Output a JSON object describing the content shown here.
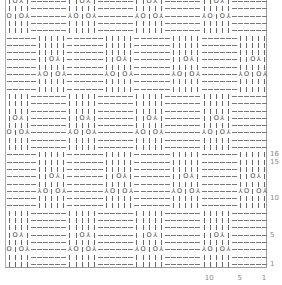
{
  "chart": {
    "title": "",
    "columns": 43,
    "rows": 37,
    "stitch_repeat": 11,
    "row_repeat": 16,
    "symbols": {
      "knit": "|",
      "purl": "-",
      "yarn_over": "O",
      "decrease": "⅄"
    },
    "lower_half": {
      "row_range": [
        1,
        8
      ],
      "purl_cols": [
        1,
        6
      ],
      "knit_cols": [
        7,
        11
      ],
      "motifs": {
        "3": {
          "11": "dec",
          "10": "yo",
          "9": "knit",
          "8": "yo",
          "7": "dec"
        },
        "5": {
          "11": "knit",
          "10": "knit",
          "9": "yo",
          "8": "dec",
          "7": "knit"
        }
      }
    },
    "upper_half": {
      "row_range": [
        9,
        16
      ],
      "knit_cols": [
        1,
        5
      ],
      "purl_cols": [
        6,
        11
      ],
      "motifs": {
        "11": {
          "5": "dec",
          "4": "yo",
          "3": "knit",
          "2": "yo",
          "1": "dec"
        },
        "13": {
          "5": "knit",
          "4": "knit",
          "3": "yo",
          "2": "dec",
          "1": "knit"
        }
      }
    }
  },
  "row_labels": [
    {
      "label": "16",
      "row": 16
    },
    {
      "label": "15",
      "row": 15
    },
    {
      "label": "10",
      "row": 10
    },
    {
      "label": "5",
      "row": 5
    },
    {
      "label": "1",
      "row": 1
    }
  ],
  "col_labels": [
    {
      "label": "10",
      "col": 10
    },
    {
      "label": "5",
      "col": 5
    },
    {
      "label": "1",
      "col": 1
    }
  ]
}
